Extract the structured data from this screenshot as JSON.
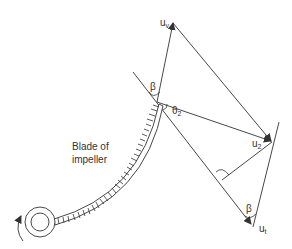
{
  "diagram": {
    "type": "velocity-diagram",
    "labels": {
      "uv": "u",
      "uv_sub": "v",
      "u2": "u",
      "u2_sub": "2",
      "ut": "u",
      "ut_sub": "t",
      "beta_top": "β",
      "beta_bottom": "β",
      "theta": "θ",
      "theta_sub": "2",
      "blade_line1": "Blade of",
      "blade_line2": "impeller"
    },
    "colors": {
      "line": "#333333",
      "background": "#ffffff"
    }
  }
}
